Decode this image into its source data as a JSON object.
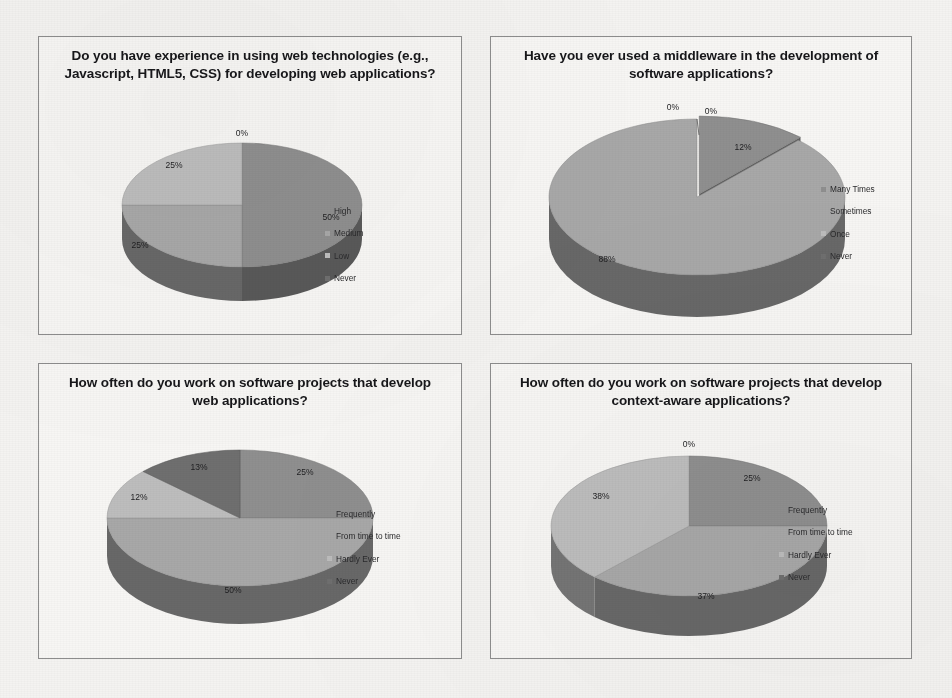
{
  "page": {
    "background": "#f4f3f1",
    "panel_background": "#f7f6f4",
    "panel_border": "#8d8d8d"
  },
  "palette": {
    "series1": "#8f8f8f",
    "series2": "#a8a8a8",
    "series3": "#bdbdbd",
    "series4": "#6f6f6f",
    "side_dark": "#5d5d5d"
  },
  "charts": [
    {
      "id": "web-tech-experience",
      "title": "Do you have experience in using web technologies (e.g., Javascript, HTML5, CSS) for developing web applications?",
      "legend": [
        "High",
        "Medium",
        "Low",
        "Never"
      ],
      "labels": [
        "50%",
        "25%",
        "25%",
        "0%"
      ]
    },
    {
      "id": "middleware-usage",
      "title": "Have you ever used a middleware in the development of software applications?",
      "legend": [
        "Many Times",
        "Sometimes",
        "Once",
        "Never"
      ],
      "labels": [
        "12%",
        "88%",
        "0%",
        "0%"
      ]
    },
    {
      "id": "web-projects-frequency",
      "title": "How often do you work on software projects that develop web applications?",
      "legend": [
        "Frequently",
        "From time to time",
        "Hardly Ever",
        "Never"
      ],
      "labels": [
        "25%",
        "50%",
        "12%",
        "13%"
      ]
    },
    {
      "id": "context-aware-projects-frequency",
      "title": "How often do you work on software projects that develop context-aware applications?",
      "legend": [
        "Frequently",
        "From time to time",
        "Hardly Ever",
        "Never"
      ],
      "labels": [
        "25%",
        "37%",
        "38%",
        "0%"
      ]
    }
  ],
  "chart_data": [
    {
      "type": "pie",
      "title": "Do you have experience in using web technologies (e.g., Javascript, HTML5, CSS) for developing web applications?",
      "categories": [
        "High",
        "Medium",
        "Low",
        "Never"
      ],
      "values": [
        50,
        25,
        25,
        0
      ],
      "data_labels": [
        "50%",
        "25%",
        "25%",
        "0%"
      ],
      "legend_position": "right",
      "three_d": true
    },
    {
      "type": "pie",
      "title": "Have you ever used a middleware in the development of software applications?",
      "categories": [
        "Many Times",
        "Sometimes",
        "Once",
        "Never"
      ],
      "values": [
        12,
        88,
        0,
        0
      ],
      "data_labels": [
        "12%",
        "88%",
        "0%",
        "0%"
      ],
      "legend_position": "right",
      "three_d": true
    },
    {
      "type": "pie",
      "title": "How often do you work on software projects that develop web applications?",
      "categories": [
        "Frequently",
        "From time to time",
        "Hardly Ever",
        "Never"
      ],
      "values": [
        25,
        50,
        12,
        13
      ],
      "data_labels": [
        "25%",
        "50%",
        "12%",
        "13%"
      ],
      "legend_position": "right",
      "three_d": true
    },
    {
      "type": "pie",
      "title": "How often do you work on software projects that develop context-aware applications?",
      "categories": [
        "Frequently",
        "From time to time",
        "Hardly Ever",
        "Never"
      ],
      "values": [
        25,
        37,
        38,
        0
      ],
      "data_labels": [
        "25%",
        "37%",
        "38%",
        "0%"
      ],
      "legend_position": "right",
      "three_d": true
    }
  ]
}
